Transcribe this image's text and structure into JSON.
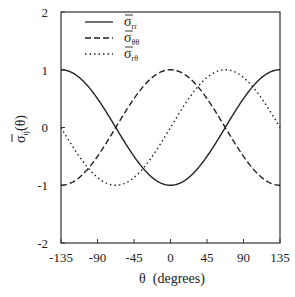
{
  "chart_data": {
    "type": "line",
    "title": "",
    "xlabel": "θ  (degrees)",
    "ylabel": "σ̄ij(θ)",
    "xlim": [
      -135,
      135
    ],
    "ylim": [
      -2,
      2
    ],
    "xticks": [
      -135,
      -90,
      -45,
      0,
      45,
      90,
      135
    ],
    "yticks": [
      -2,
      -1,
      0,
      1,
      2
    ],
    "grid": false,
    "legend_position": "upper-left-inside",
    "x": [
      -135,
      -112.5,
      -90,
      -67.5,
      -45,
      -22.5,
      0,
      22.5,
      45,
      67.5,
      90,
      112.5,
      135
    ],
    "series": [
      {
        "name": "σ̄rr",
        "symbol": "σ",
        "subscript": "rr",
        "style": "solid",
        "formula": "-cos(4θ/3)",
        "values": [
          1,
          0.866,
          0.5,
          0,
          -0.5,
          -0.866,
          -1,
          -0.866,
          -0.5,
          0,
          0.5,
          0.866,
          1
        ]
      },
      {
        "name": "σ̄θθ",
        "symbol": "σ",
        "subscript": "θθ",
        "style": "dashed",
        "formula": "cos(4θ/3)",
        "values": [
          -1,
          -0.866,
          -0.5,
          0,
          0.5,
          0.866,
          1,
          0.866,
          0.5,
          0,
          -0.5,
          -0.866,
          -1
        ]
      },
      {
        "name": "σ̄rθ",
        "symbol": "σ",
        "subscript": "rθ",
        "style": "dotted",
        "formula": "sin(4θ/3)",
        "values": [
          0,
          -0.5,
          -0.866,
          -1,
          -0.866,
          -0.5,
          0,
          0.5,
          0.866,
          1,
          0.866,
          0.5,
          0
        ]
      }
    ]
  },
  "axes": {
    "x_title": "θ  (degrees)",
    "y_title_symbol": "σ",
    "y_title_sub": "ij",
    "y_title_arg": "(θ)",
    "x_tick_labels": [
      "-135",
      "-90",
      "-45",
      "0",
      "45",
      "90",
      "135"
    ],
    "y_tick_labels": [
      "-2",
      "-1",
      "0",
      "1",
      "2"
    ]
  },
  "legend": [
    {
      "symbol": "σ",
      "sub": "rr"
    },
    {
      "symbol": "σ",
      "sub": "θθ"
    },
    {
      "symbol": "σ",
      "sub": "rθ"
    }
  ],
  "colors": {
    "line": "#222222",
    "frame": "#333333"
  }
}
